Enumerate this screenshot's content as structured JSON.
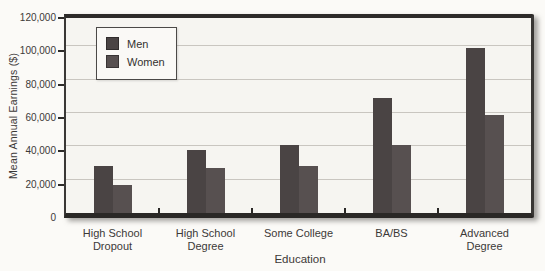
{
  "chart_data": {
    "type": "bar",
    "title": "",
    "xlabel": "Education",
    "ylabel": "Mean Annual Earnings ($)",
    "categories": [
      "High School\nDropout",
      "High School\nDegree",
      "Some College",
      "BA/BS",
      "Advanced\nDegree"
    ],
    "series": [
      {
        "name": "Men",
        "color": "#4a4444",
        "values": [
          28000,
          38000,
          41000,
          69000,
          99000
        ]
      },
      {
        "name": "Women",
        "color": "#575050",
        "values": [
          17000,
          27000,
          28000,
          41000,
          59000
        ]
      }
    ],
    "ylim": [
      0,
      120000
    ],
    "yticks": [
      0,
      20000,
      40000,
      60000,
      80000,
      100000,
      120000
    ],
    "ytick_labels": [
      "0",
      "20,000",
      "40,000",
      "60,000",
      "80,000",
      "100,000",
      "120,000"
    ],
    "grid": true,
    "legend_position": "top-left"
  },
  "colors": {
    "paper": "#fbfaf7",
    "plot_bg": "#f6f5f1",
    "gridline": "#c9c6c0",
    "axis": "#2d2b29",
    "text": "#3b3937",
    "legend_bg": "#faf9f6",
    "legend_border": "#4b4947"
  }
}
